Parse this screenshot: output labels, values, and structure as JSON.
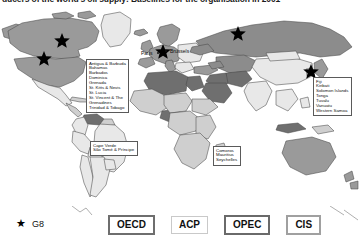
{
  "caption": {
    "text": "ducers of the world's oil supply: Baselines for the organisation in 2001"
  },
  "map": {
    "title": "world-map-economic-groupings",
    "city_labels": [
      {
        "id": "paris",
        "name": "Paris"
      },
      {
        "id": "brussels",
        "name": "Brussels"
      }
    ],
    "island_groups": [
      {
        "id": "caribbean",
        "countries": "Antigua & Barbuda\nBahamas\nBarbados\nDominica\nGrenada\nSt. Kitts & Nevis\nSt. Lucia\nSt. Vincent & The\nGrenadines\nTrinidad & Tobago"
      },
      {
        "id": "atlantic-africa",
        "countries": "Cape Verde\nSão Tomé & Príncipe"
      },
      {
        "id": "indian-ocean",
        "countries": "Comoros\nMauritius\nSeychelles"
      },
      {
        "id": "pacific",
        "countries": "Fiji\nKiribati\nSolomon Islands\nTonga\nTuvalu\nVanuatu\nWestern Samoa"
      }
    ],
    "g8_star_markers": [
      {
        "country": "Canada",
        "x": 62,
        "y": 32
      },
      {
        "country": "United States",
        "x": 44,
        "y": 50
      },
      {
        "country": "Russia",
        "x": 238,
        "y": 25
      },
      {
        "country": "Japan",
        "x": 311,
        "y": 63
      },
      {
        "country": "Europe",
        "x": 163,
        "y": 43
      }
    ],
    "colors": {
      "oecd": "#9a9a9a",
      "acp": "#cfcfcf",
      "opec": "#6f6f6f",
      "cis": "#8c8c8c",
      "other": "#e8e8e8",
      "outline": "#4a4a4a",
      "ocean": "#ffffff"
    }
  },
  "legend": {
    "star": {
      "glyph": "★",
      "label": "G8"
    },
    "groups": [
      {
        "id": "oecd",
        "label": "OECD"
      },
      {
        "id": "acp",
        "label": "ACP"
      },
      {
        "id": "opec",
        "label": "OPEC"
      },
      {
        "id": "cis",
        "label": "CIS"
      }
    ]
  }
}
